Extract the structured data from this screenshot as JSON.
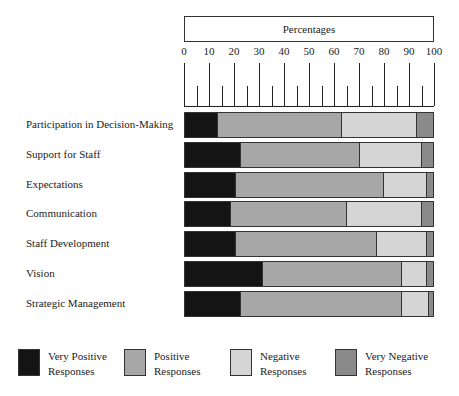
{
  "chart_data": {
    "type": "bar",
    "orientation": "horizontal",
    "stacked": true,
    "title": "Percentages",
    "xlabel": "Percentages",
    "ylabel": "",
    "xlim": [
      0,
      100
    ],
    "x_ticks": [
      0,
      10,
      20,
      30,
      40,
      50,
      60,
      70,
      80,
      90,
      100
    ],
    "grid": false,
    "legend_position": "bottom",
    "categories": [
      "Participation in Decision-Making",
      "Support for Staff",
      "Expectations",
      "Communication",
      "Staff Development",
      "Vision",
      "Strategic Management"
    ],
    "series": [
      {
        "name": "Very Positive Responses",
        "color": "#141414",
        "values": [
          13,
          22,
          20,
          18,
          20,
          31,
          22
        ]
      },
      {
        "name": "Positive Responses",
        "color": "#a7a7a7",
        "values": [
          50,
          48,
          60,
          47,
          57,
          56,
          65
        ]
      },
      {
        "name": "Negative Responses",
        "color": "#d5d5d5",
        "values": [
          30,
          25,
          17,
          30,
          20,
          10,
          11
        ]
      },
      {
        "name": "Very Negative Responses",
        "color": "#8a8a8a",
        "values": [
          7,
          5,
          3,
          5,
          3,
          3,
          2
        ]
      }
    ]
  },
  "header": {
    "title": "Percentages"
  },
  "legend": [
    {
      "line1": "Very Positive",
      "line2": "Responses"
    },
    {
      "line1": "Positive",
      "line2": "Responses"
    },
    {
      "line1": "Negative",
      "line2": "Responses"
    },
    {
      "line1": "Very Negative",
      "line2": "Responses"
    }
  ]
}
